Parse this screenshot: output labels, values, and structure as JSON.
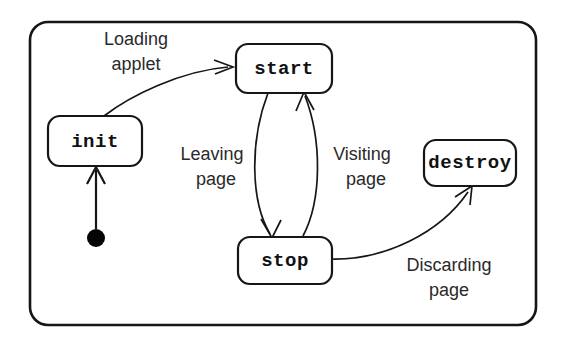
{
  "diagram": {
    "type": "uml-state-diagram",
    "background_color": "#ffffff",
    "stroke_color": "#161616",
    "frame": {
      "name": "outer-frame",
      "x": 30,
      "y": 22,
      "width": 506,
      "height": 303,
      "corner_radius": 18
    },
    "initial_state": {
      "name": "initial-state-dot",
      "cx": 96,
      "cy": 238,
      "r": 9,
      "color": "#050505"
    },
    "states": [
      {
        "id": "init",
        "label": "init",
        "x": 48,
        "y": 116,
        "width": 94,
        "height": 50,
        "corner_radius": 12
      },
      {
        "id": "start",
        "label": "start",
        "x": 236,
        "y": 44,
        "width": 96,
        "height": 49,
        "corner_radius": 12
      },
      {
        "id": "stop",
        "label": "stop",
        "x": 238,
        "y": 237,
        "width": 94,
        "height": 47,
        "corner_radius": 12
      },
      {
        "id": "destroy",
        "label": "destroy",
        "x": 424,
        "y": 140,
        "width": 92,
        "height": 46,
        "corner_radius": 12
      }
    ],
    "transitions": [
      {
        "id": "start-to-init",
        "from": "initial-state-dot",
        "to": "init",
        "label": "",
        "shape": "straight-up"
      },
      {
        "id": "init-to-start",
        "from": "init",
        "to": "start",
        "label": "Loading applet",
        "label_lines": [
          "Loading",
          "applet"
        ],
        "label_x": 136,
        "label_y": 45,
        "shape": "curve-up-right"
      },
      {
        "id": "start-to-stop",
        "from": "start",
        "to": "stop",
        "label": "Leaving page",
        "label_lines": [
          "Leaving",
          "page"
        ],
        "label_x": 212,
        "label_y": 153,
        "shape": "bow-left-down"
      },
      {
        "id": "stop-to-start",
        "from": "stop",
        "to": "start",
        "label": "Visiting page",
        "label_lines": [
          "Visiting",
          "page"
        ],
        "label_x": 362,
        "label_y": 153,
        "shape": "bow-right-up"
      },
      {
        "id": "stop-to-destroy",
        "from": "stop",
        "to": "destroy",
        "label": "Discarding page",
        "label_lines": [
          "Discarding",
          "page"
        ],
        "label_x": 447,
        "label_y": 264,
        "shape": "curve-up-right"
      }
    ]
  }
}
